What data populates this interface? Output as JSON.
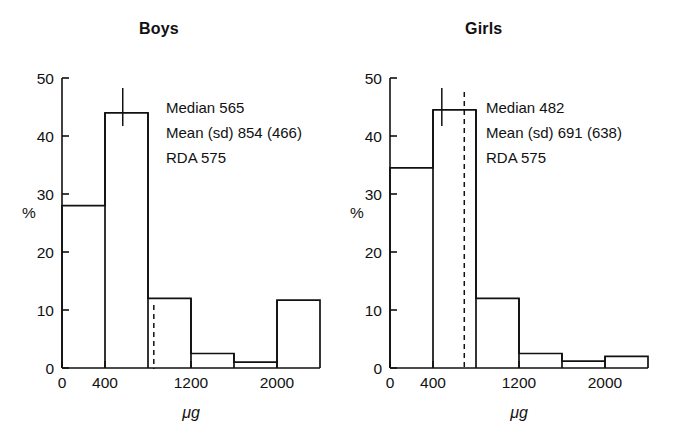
{
  "chart_data": [
    {
      "type": "bar",
      "title": "Boys",
      "xlabel": "μg",
      "ylabel": "%",
      "xlim": [
        0,
        2400
      ],
      "ylim": [
        0,
        50
      ],
      "grid": false,
      "legend": "none",
      "bin_width": 400,
      "categories": [
        "0-400",
        "400-800",
        "800-1200",
        "1200-1600",
        "1600-2000",
        "2000-2400"
      ],
      "bin_edges": [
        0,
        400,
        800,
        1200,
        1600,
        2000,
        2400
      ],
      "values": [
        28,
        44,
        12,
        2.5,
        1,
        11.7
      ],
      "xticks": [
        0,
        400,
        1200,
        2000
      ],
      "xtick_labels": [
        "0",
        "400",
        "1200",
        "2000"
      ],
      "xticks_minor": [
        800,
        1600,
        2400
      ],
      "yticks": [
        0,
        10,
        20,
        30,
        40,
        50
      ],
      "ytick_labels": [
        "0",
        "10",
        "20",
        "30",
        "40",
        "50"
      ],
      "markers": [
        {
          "name": "median",
          "value": 565,
          "style": "solid"
        },
        {
          "name": "mean",
          "value": 854,
          "style": "dashed"
        }
      ],
      "annotations": [
        "Median 565",
        "Mean (sd) 854 (466)",
        "RDA 575"
      ]
    },
    {
      "type": "bar",
      "title": "Girls",
      "xlabel": "μg",
      "ylabel": "%",
      "xlim": [
        0,
        2400
      ],
      "ylim": [
        0,
        50
      ],
      "grid": false,
      "legend": "none",
      "bin_width": 400,
      "categories": [
        "0-400",
        "400-800",
        "800-1200",
        "1200-1600",
        "1600-2000",
        "2000-2400"
      ],
      "bin_edges": [
        0,
        400,
        800,
        1200,
        1600,
        2000,
        2400
      ],
      "values": [
        34.5,
        44.5,
        12,
        2.5,
        1.2,
        2
      ],
      "xticks": [
        0,
        400,
        1200,
        2000
      ],
      "xtick_labels": [
        "0",
        "400",
        "1200",
        "2000"
      ],
      "xticks_minor": [
        800,
        1600,
        2400
      ],
      "yticks": [
        0,
        10,
        20,
        30,
        40,
        50
      ],
      "ytick_labels": [
        "0",
        "10",
        "20",
        "30",
        "40",
        "50"
      ],
      "markers": [
        {
          "name": "median",
          "value": 482,
          "style": "solid"
        },
        {
          "name": "mean",
          "value": 691,
          "style": "dashed"
        }
      ],
      "annotations": [
        "Median 482",
        "Mean (sd) 691 (638)",
        "RDA 575"
      ]
    }
  ],
  "boys": {
    "title": "Boys",
    "ylabel": "%",
    "xunit": "μg",
    "annot": {
      "median": "Median 565",
      "mean": "Mean (sd) 854 (466)",
      "rda": "RDA 575"
    },
    "xtick_labels": [
      "0",
      "400",
      "1200",
      "2000"
    ],
    "ytick_labels": [
      "0",
      "10",
      "20",
      "30",
      "40",
      "50"
    ]
  },
  "girls": {
    "title": "Girls",
    "ylabel": "%",
    "xunit": "μg",
    "annot": {
      "median": "Median 482",
      "mean": "Mean (sd) 691 (638)",
      "rda": "RDA 575"
    },
    "xtick_labels": [
      "0",
      "400",
      "1200",
      "2000"
    ],
    "ytick_labels": [
      "0",
      "10",
      "20",
      "30",
      "40",
      "50"
    ]
  },
  "colors": {
    "ink": "#111111",
    "background": "#ffffff"
  }
}
